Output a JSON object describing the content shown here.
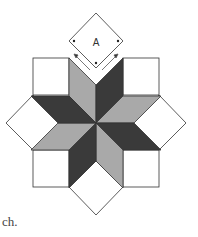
{
  "diagram": {
    "template_label": "A",
    "caption_fragment": "ch.",
    "colors": {
      "dark": "#3a3a3a",
      "light": "#a9a9a9",
      "background": "#ffffff",
      "stroke": "#333333"
    },
    "pieces": [
      {
        "name": "template-diamond-A",
        "fill": "white"
      },
      {
        "name": "diamond-dark",
        "count": 4
      },
      {
        "name": "diamond-light",
        "count": 4
      },
      {
        "name": "corner-square",
        "count": 4
      },
      {
        "name": "side-triangle-diamond",
        "count": 4
      }
    ]
  }
}
